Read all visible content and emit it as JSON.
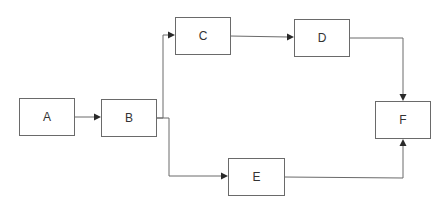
{
  "diagram": {
    "type": "flowchart",
    "nodes": [
      {
        "id": "A",
        "label": "A"
      },
      {
        "id": "B",
        "label": "B"
      },
      {
        "id": "C",
        "label": "C"
      },
      {
        "id": "D",
        "label": "D"
      },
      {
        "id": "E",
        "label": "E"
      },
      {
        "id": "F",
        "label": "F"
      }
    ],
    "edges": [
      {
        "from": "A",
        "to": "B"
      },
      {
        "from": "B",
        "to": "C"
      },
      {
        "from": "B",
        "to": "E"
      },
      {
        "from": "C",
        "to": "D"
      },
      {
        "from": "D",
        "to": "F"
      },
      {
        "from": "E",
        "to": "F"
      }
    ],
    "colors": {
      "stroke": "#6a6a6a",
      "arrowhead": "#2a2a2a",
      "text": "#333333",
      "background": "#ffffff"
    }
  }
}
